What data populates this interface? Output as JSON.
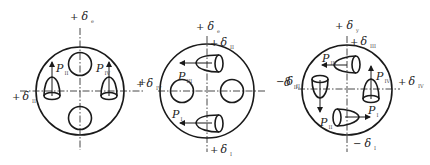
{
  "figure": {
    "colors": {
      "line": "#1a1a1a",
      "background": "#ffffff"
    },
    "panels": [
      {
        "id": "panel-1",
        "labels": {
          "top": {
            "sign": "+",
            "symbol": "δ",
            "sub": "e"
          },
          "left": {
            "sign": "+",
            "symbol": "δ",
            "sub": "II"
          },
          "right": {
            "sign": "+",
            "symbol": "",
            "sub": ""
          },
          "p_left": {
            "symbol": "P",
            "sub": "II"
          },
          "p_right": {
            "symbol": "P",
            "sub": "IV"
          }
        }
      },
      {
        "id": "panel-2",
        "labels": {
          "top": {
            "sign": "+",
            "symbol": "δ",
            "sub": "e"
          },
          "top2": {
            "sign": "+",
            "symbol": "δ",
            "sub": "II"
          },
          "left": {
            "sign": "+",
            "symbol": "δ",
            "sub": "IV"
          },
          "right": {
            "sign": "−",
            "symbol": "δ",
            "sub": "II"
          },
          "bottom": {
            "sign": "+",
            "symbol": "δ",
            "sub": "I"
          },
          "p_upper": {
            "symbol": "P",
            "sub": "III"
          },
          "p_lower": {
            "symbol": "P",
            "sub": "I"
          }
        }
      },
      {
        "id": "panel-3",
        "labels": {
          "top": {
            "sign": "+",
            "symbol": "δ",
            "sub": "y"
          },
          "top2": {
            "sign": "+",
            "symbol": "δ",
            "sub": "III"
          },
          "left": {
            "sign": "",
            "symbol": "δ",
            "sub": "II"
          },
          "right": {
            "sign": "+",
            "symbol": "δ",
            "sub": "IV"
          },
          "bottom": {
            "sign": "−",
            "symbol": "δ",
            "sub": "I"
          },
          "p_top": {
            "symbol": "P",
            "sub": "III"
          },
          "p_right": {
            "symbol": "P",
            "sub": "IV"
          },
          "p_left": {
            "symbol": "P",
            "sub": "II"
          },
          "p_bottom": {
            "symbol": "P",
            "sub": "I"
          }
        }
      }
    ]
  }
}
